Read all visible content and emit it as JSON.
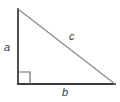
{
  "figure": {
    "name": "right-triangle-diagram",
    "background_color": "#ffffff",
    "labels": {
      "leg_vertical": "a",
      "leg_horizontal": "b",
      "hypotenuse": "c"
    },
    "colors": {
      "leg_stroke": "#3b3b3b",
      "hypotenuse_stroke": "#8c8c8c",
      "right_angle_stroke": "#6e6e6e",
      "label_text": "#3b3b3b"
    },
    "geometry": {
      "vertex_top": [
        18,
        9
      ],
      "vertex_bottom_left": [
        18,
        84
      ],
      "vertex_bottom_right": [
        115,
        84
      ],
      "right_angle_marker_size": 12,
      "right_angle_vertex": [
        18,
        84
      ]
    },
    "strokes": {
      "leg_width": 1.8,
      "hypotenuse_width": 1.3,
      "right_angle_width": 1.2
    }
  }
}
